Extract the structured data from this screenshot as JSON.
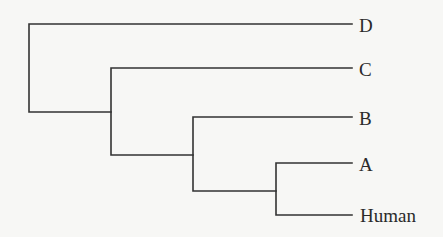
{
  "diagram": {
    "type": "phylogenetic-tree",
    "orientation": "left-to-right",
    "leaves": [
      {
        "id": "D",
        "label": "D",
        "y": 24
      },
      {
        "id": "C",
        "label": "C",
        "y": 68
      },
      {
        "id": "B",
        "label": "B",
        "y": 117
      },
      {
        "id": "A",
        "label": "A",
        "y": 163
      },
      {
        "id": "Human",
        "label": "Human",
        "y": 215
      }
    ],
    "topology": "(D,(C,(B,(A,Human))))",
    "colors": {
      "line": "#333333",
      "text": "#2a2a2a",
      "background": "#f7f7f5"
    }
  }
}
